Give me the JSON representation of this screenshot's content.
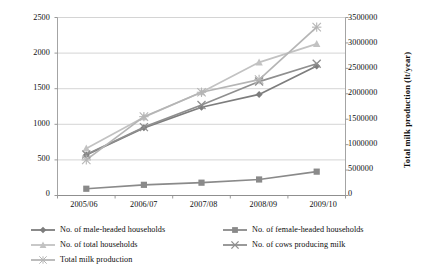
{
  "chart_data": {
    "type": "line",
    "title": "",
    "xlabel": "",
    "ylabel": "",
    "categories": [
      "2005/06",
      "2006/07",
      "2007/08",
      "2008/09",
      "2009/10"
    ],
    "grid": true,
    "legend_position": "bottom",
    "axes": {
      "left": {
        "label": "",
        "ylim": [
          0,
          2500
        ],
        "ticks": [
          "0",
          "500",
          "1000",
          "1500",
          "2000",
          "2500"
        ],
        "tick_values": [
          0,
          500,
          1000,
          1500,
          2000,
          2500
        ]
      },
      "right": {
        "label": "Total milk production (lt/year)",
        "ylim": [
          0,
          3500000
        ],
        "ticks": [
          "0",
          "500000",
          "1000000",
          "1500000",
          "2000000",
          "2500000",
          "3000000",
          "3500000"
        ],
        "tick_values": [
          0,
          500000,
          1000000,
          1500000,
          2000000,
          2500000,
          3000000,
          3500000
        ]
      }
    },
    "series": [
      {
        "name": "No. of male-headed households",
        "axis": "left",
        "marker": "diamond",
        "color": "#7d7d7d",
        "values": [
          570,
          950,
          1240,
          1420,
          1820
        ]
      },
      {
        "name": "No. of female-headed households",
        "axis": "left",
        "marker": "square",
        "color": "#8a8a8a",
        "values": [
          95,
          150,
          180,
          225,
          335
        ]
      },
      {
        "name": "No. of total households",
        "axis": "left",
        "marker": "triangle",
        "color": "#c2c2c2",
        "values": [
          660,
          1100,
          1450,
          1870,
          2130
        ]
      },
      {
        "name": "No. of cows producing milk",
        "axis": "left",
        "marker": "cross",
        "color": "#8f8f8f",
        "values": [
          575,
          960,
          1270,
          1600,
          1850
        ]
      },
      {
        "name": "Total milk production",
        "axis": "right",
        "marker": "star",
        "color": "#b5b5b5",
        "values": [
          700000,
          1550000,
          2030000,
          2280000,
          3310000
        ]
      }
    ]
  },
  "legend": {
    "items": [
      {
        "label": "No. of male-headed households",
        "marker": "diamond",
        "color": "#7d7d7d"
      },
      {
        "label": "No. of female-headed households",
        "marker": "square",
        "color": "#8a8a8a"
      },
      {
        "label": "No. of total households",
        "marker": "triangle",
        "color": "#c2c2c2"
      },
      {
        "label": "No. of cows producing milk",
        "marker": "cross",
        "color": "#8f8f8f"
      },
      {
        "label": "Total milk production",
        "marker": "star",
        "color": "#b5b5b5"
      }
    ]
  }
}
